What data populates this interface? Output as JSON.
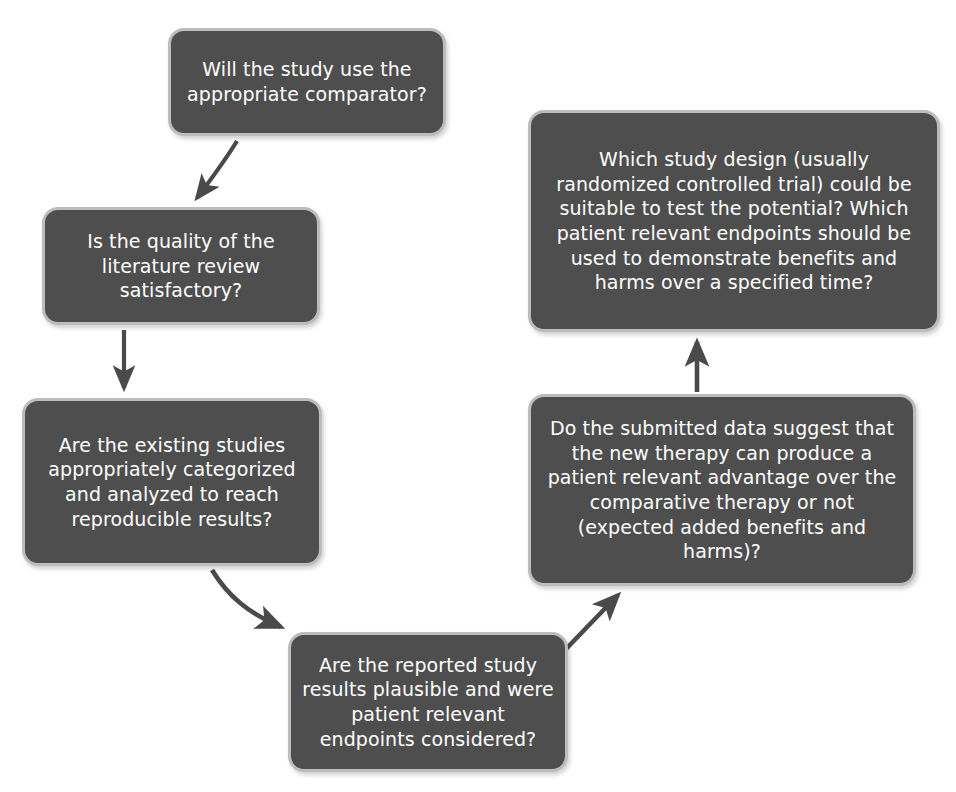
{
  "diagram": {
    "type": "flowchart",
    "background_color": "#ffffff",
    "node_fill_color": "#4e4e4e",
    "node_border_color": "#bcbcbc",
    "node_text_color": "#ffffff",
    "arrow_color": "#4a4a4a",
    "nodes": [
      {
        "id": "comparator",
        "text": "Will the study use the appropriate comparator?"
      },
      {
        "id": "literature",
        "text": "Is the quality of the literature review satisfactory?"
      },
      {
        "id": "existing",
        "text": "Are the existing studies appropriately categorized and analyzed to reach reproducible results?"
      },
      {
        "id": "reported",
        "text": "Are the reported study results plausible and were patient relevant endpoints considered?"
      },
      {
        "id": "submitted",
        "text": "Do the submitted data suggest that the new therapy can produce a patient relevant advantage over the comparative therapy or not (expected added benefits and harms)?"
      },
      {
        "id": "design",
        "text": "Which study design (usually randomized controlled trial) could be suitable to test the potential? Which patient relevant endpoints should be used to demonstrate benefits and harms over a specified time?"
      }
    ],
    "edges": [
      {
        "id": "e1",
        "from": "comparator",
        "to": "literature",
        "style": "curved-down-left"
      },
      {
        "id": "e2",
        "from": "literature",
        "to": "existing",
        "style": "straight-down"
      },
      {
        "id": "e3",
        "from": "existing",
        "to": "reported",
        "style": "curved-down-right"
      },
      {
        "id": "e4",
        "from": "reported",
        "to": "submitted",
        "style": "straight-up-right"
      },
      {
        "id": "e5",
        "from": "submitted",
        "to": "design",
        "style": "straight-up"
      }
    ]
  }
}
